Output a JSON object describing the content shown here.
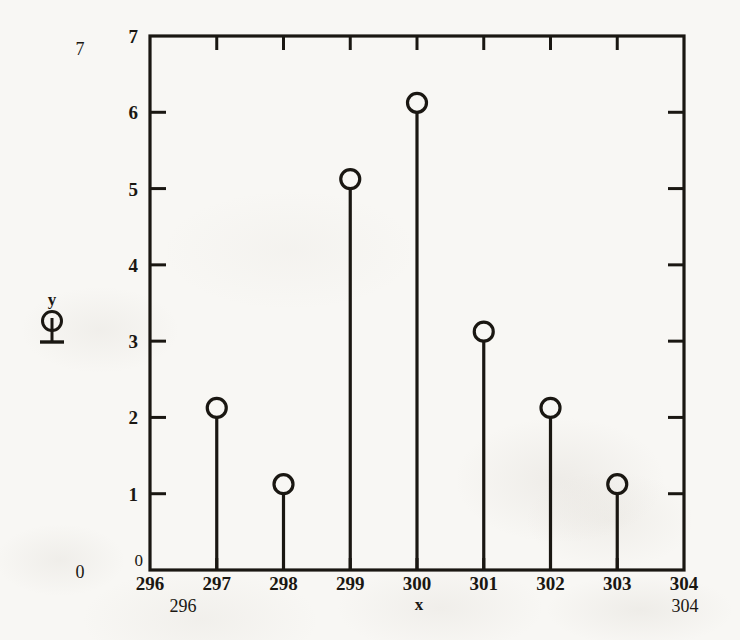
{
  "chart_data": {
    "type": "bar",
    "subtype": "stem",
    "title": "",
    "subtitle": "",
    "xlabel": "x",
    "ylabel": "y",
    "categories": [
      297,
      298,
      299,
      300,
      301,
      302,
      303
    ],
    "values": [
      2,
      1,
      5,
      6,
      3,
      2,
      1
    ],
    "series": [
      {
        "name": "y",
        "x": [
          297,
          298,
          299,
          300,
          301,
          302,
          303
        ],
        "values": [
          2,
          1,
          5,
          6,
          3,
          2,
          1
        ]
      }
    ],
    "xlim": [
      296,
      304
    ],
    "ylim": [
      0,
      7
    ],
    "xticks": [
      296,
      297,
      298,
      299,
      300,
      301,
      302,
      303,
      304
    ],
    "xtick_labels": [
      "296",
      "297",
      "298",
      "299",
      "300",
      "301",
      "302",
      "303",
      "304"
    ],
    "yticks": [
      0,
      1,
      2,
      3,
      4,
      5,
      6,
      7
    ],
    "ytick_labels": [
      "0",
      "1",
      "2",
      "3",
      "4",
      "5",
      "6",
      "7"
    ],
    "grid": false,
    "legend": false,
    "legend_position": "none",
    "marker": "open-circle",
    "frame": "box-all-sides",
    "tick_direction": "inward"
  },
  "axes": {
    "x_axis_name": "x",
    "y_axis_name": "y",
    "x_tick_labels": [
      "296",
      "297",
      "298",
      "299",
      "300",
      "301",
      "302",
      "303",
      "304"
    ],
    "y_tick_labels": [
      "0",
      "1",
      "2",
      "3",
      "4",
      "5",
      "6",
      "7"
    ],
    "corner_zero_label": "0"
  },
  "outer_labels": {
    "y_max": "7",
    "y_min": "0",
    "x_min": "296",
    "x_max": "304"
  },
  "colors": {
    "ink": "#1a1712",
    "paper": "#f8f7f4"
  },
  "legend_glyph": {
    "name": "stem-marker-glyph",
    "description": "open circle on a vertical stem with baseline"
  }
}
